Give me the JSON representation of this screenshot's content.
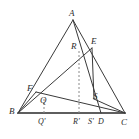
{
  "figure": {
    "canvas": {
      "width": 139,
      "height": 139,
      "background": "#ffffff"
    },
    "style": {
      "stroke_color": "#3a3a3a",
      "baseline_color": "#2a2a2a",
      "dashed_color": "#8a8a8a",
      "label_color": "#2b2b2b",
      "stroke_width": 1,
      "baseline_width": 1.6,
      "dash_pattern": "2,2"
    },
    "points": [
      {
        "id": "A",
        "label": "A",
        "x": 73,
        "y": 20,
        "label_x": 69,
        "label_y": 9,
        "kind": "vertex"
      },
      {
        "id": "B",
        "label": "B",
        "x": 18,
        "y": 113,
        "label_x": 9,
        "label_y": 107,
        "kind": "vertex"
      },
      {
        "id": "C",
        "label": "C",
        "x": 125,
        "y": 113,
        "label_x": 121,
        "label_y": 118,
        "kind": "vertex"
      },
      {
        "id": "E",
        "label": "E",
        "x": 92,
        "y": 48,
        "label_x": 91,
        "label_y": 37,
        "kind": "point"
      },
      {
        "id": "R",
        "label": "R",
        "x": 79,
        "y": 51,
        "label_x": 71,
        "label_y": 42,
        "kind": "point"
      },
      {
        "id": "F",
        "label": "F",
        "x": 36,
        "y": 92,
        "label_x": 27,
        "label_y": 84,
        "kind": "point"
      },
      {
        "id": "Q",
        "label": "Q",
        "x": 44,
        "y": 99,
        "label_x": 40,
        "label_y": 96,
        "kind": "point"
      },
      {
        "id": "S",
        "label": "S",
        "x": 94,
        "y": 99,
        "label_x": 93,
        "label_y": 92,
        "kind": "point"
      },
      {
        "id": "Qp",
        "label": "Q'",
        "x": 44,
        "y": 113,
        "label_x": 38,
        "label_y": 118,
        "kind": "foot"
      },
      {
        "id": "Rp",
        "label": "R'",
        "x": 79,
        "y": 113,
        "label_x": 73,
        "label_y": 118,
        "kind": "foot"
      },
      {
        "id": "Sp",
        "label": "S'",
        "x": 94,
        "y": 113,
        "label_x": 88,
        "label_y": 118,
        "kind": "foot"
      },
      {
        "id": "D",
        "label": "D",
        "x": 101,
        "y": 113,
        "label_x": 98,
        "label_y": 118,
        "kind": "foot"
      }
    ],
    "solid_segments": [
      {
        "id": "AB",
        "from": "A",
        "to": "B",
        "name": "side-ab"
      },
      {
        "id": "AC",
        "from": "A",
        "to": "C",
        "name": "side-ac"
      },
      {
        "id": "BC",
        "from": "B",
        "to": "C",
        "name": "base-bc"
      },
      {
        "id": "AD",
        "from": "A",
        "to": "D",
        "name": "cevian-ad"
      },
      {
        "id": "BE",
        "from": "B",
        "to": "E",
        "name": "cevian-be"
      },
      {
        "id": "FC",
        "from": "F",
        "to": "C",
        "name": "cevian-fc"
      },
      {
        "id": "ES",
        "from": "E",
        "to": "S",
        "name": "segment-es"
      },
      {
        "id": "SC",
        "from": "S",
        "to": "C",
        "name": "segment-sc"
      },
      {
        "id": "BF",
        "from": "B",
        "to": "F",
        "name": "segment-bf"
      }
    ],
    "dashed_segments": [
      {
        "id": "QQp",
        "from": "Q",
        "to": "Qp",
        "name": "projection-q"
      },
      {
        "id": "RRp",
        "from": "R",
        "to": "Rp",
        "name": "projection-r"
      }
    ]
  }
}
